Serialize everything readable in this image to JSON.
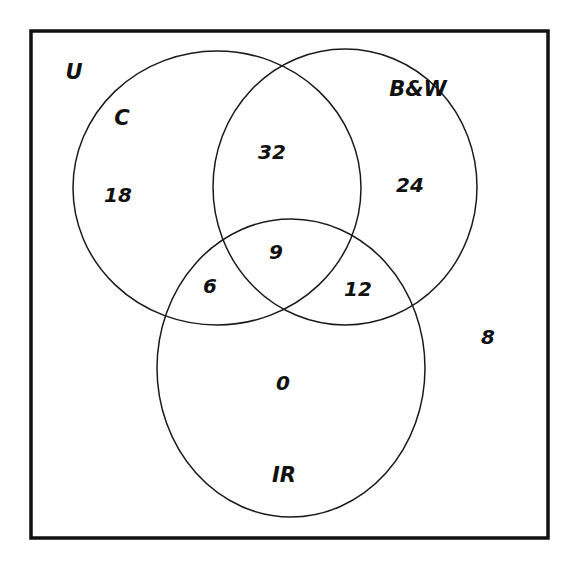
{
  "diagram": {
    "type": "venn-3-set",
    "universe_label": "U",
    "sets": [
      {
        "key": "C",
        "label": "C"
      },
      {
        "key": "BW",
        "label": "B&W"
      },
      {
        "key": "IR",
        "label": "IR"
      }
    ],
    "regions": {
      "only_C": "18",
      "only_BW": "24",
      "only_IR": "0",
      "C_and_BW_only": "32",
      "C_and_IR_only": "6",
      "BW_and_IR_only": "12",
      "all_three": "9",
      "outside_all": "8"
    },
    "colors": {
      "stroke": "#1a1a1a",
      "text": "#111111",
      "background": "#ffffff"
    }
  }
}
